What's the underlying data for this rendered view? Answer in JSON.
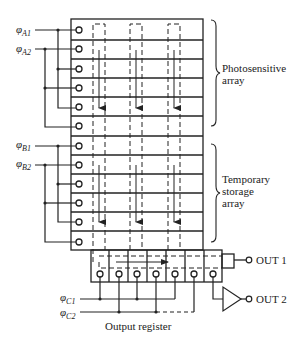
{
  "diagram": {
    "type": "CCD frame-transfer imager schematic",
    "labels": {
      "photosensitive_array": [
        "Photosensitive",
        "array"
      ],
      "temporary_storage_array": [
        "Temporary",
        "storage",
        "array"
      ],
      "output_register": "Output register",
      "out1": "OUT 1",
      "out2": "OUT 2"
    },
    "clocks": {
      "a1": {
        "phi": "φ",
        "sub": "A1"
      },
      "a2": {
        "phi": "φ",
        "sub": "A2"
      },
      "b1": {
        "phi": "φ",
        "sub": "B1"
      },
      "b2": {
        "phi": "φ",
        "sub": "B2"
      },
      "c1": {
        "phi": "φ",
        "sub": "C1"
      },
      "c2": {
        "phi": "φ",
        "sub": "C2"
      }
    },
    "photosensitive_rows": 6,
    "storage_rows": 6,
    "columns": 3,
    "register_stages": 7,
    "colors": {
      "line": "#222222",
      "background": "#ffffff"
    }
  }
}
